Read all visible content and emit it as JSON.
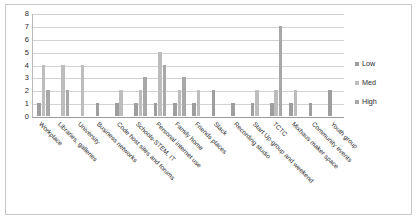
{
  "figure": {
    "background": "#ffffff",
    "border_color": "#c8c8c8"
  },
  "chart_data": {
    "type": "bar",
    "title": "",
    "subtitle": "",
    "xlabel": "",
    "ylabel": "",
    "ylim": [
      0,
      8
    ],
    "yticks": [
      "0",
      "1",
      "2",
      "3",
      "4",
      "5",
      "6",
      "7",
      "8"
    ],
    "grid": true,
    "legend_position": "right",
    "categories": [
      "Workplace",
      "Libraries, galleries",
      "University",
      "Business networks",
      "Code host sites and forums",
      "Schools-STEM, IT",
      "Personal internet use",
      "Family home",
      "Friends places",
      "Slack",
      "Recording studio",
      "Start Up-group and weekend",
      "TCTC",
      "Mixhaus maker space",
      "Community events",
      "Youth group"
    ],
    "series": [
      {
        "name": "Low",
        "color": "#9e9e9e",
        "values": [
          1,
          0,
          0,
          1,
          1,
          1,
          1,
          1,
          1,
          2,
          1,
          1,
          1,
          1,
          1,
          2
        ]
      },
      {
        "name": "Med",
        "color": "#bdbdbd",
        "values": [
          4,
          4,
          4,
          0,
          2,
          2,
          5,
          2,
          2,
          0,
          0,
          2,
          2,
          2,
          0,
          0
        ]
      },
      {
        "name": "High",
        "color": "#a8a8a8",
        "values": [
          2,
          2,
          0,
          0,
          0,
          3,
          4,
          3,
          0,
          0,
          0,
          0,
          7,
          0,
          0,
          0
        ]
      }
    ]
  },
  "legend": {
    "items": [
      {
        "label": "Low",
        "color": "#9e9e9e"
      },
      {
        "label": "Med",
        "color": "#bdbdbd"
      },
      {
        "label": "High",
        "color": "#a8a8a8"
      }
    ]
  }
}
